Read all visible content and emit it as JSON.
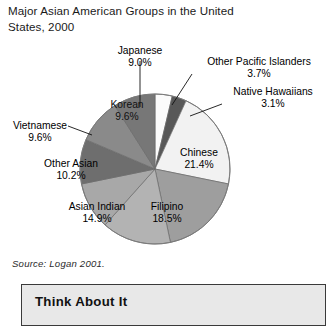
{
  "title": "Major Asian American Groups in the United\nStates, 2000",
  "source": "Source: Logan 2001.",
  "think_box": {
    "heading": "Think About It"
  },
  "chart_data": {
    "type": "pie",
    "title": "Major Asian American Groups in the United States, 2000",
    "subtitle": "",
    "xlabel": "",
    "ylabel": "",
    "units": "percent",
    "legend_position": "none",
    "labels_on_slices": true,
    "source": "Source: Logan 2001.",
    "start_angle_deg": 0,
    "direction": "clockwise",
    "categories": [
      "Other Pacific Islanders",
      "Native Hawaiians",
      "Chinese",
      "Filipino",
      "Asian Indian",
      "Other Asian",
      "Vietnamese",
      "Korean",
      "Japanese"
    ],
    "values": [
      3.7,
      3.1,
      21.4,
      18.5,
      14.9,
      10.2,
      9.6,
      9.6,
      9.0
    ],
    "slices": [
      {
        "label": "Other Pacific Islanders",
        "value": 3.7,
        "pct_text": "3.7%",
        "color": "#fbfbfb",
        "label_placement": "outside",
        "leader": true
      },
      {
        "label": "Native Hawaiians",
        "value": 3.1,
        "pct_text": "3.1%",
        "color": "#585858",
        "label_placement": "outside",
        "leader": true
      },
      {
        "label": "Chinese",
        "value": 21.4,
        "pct_text": "21.4%",
        "color": "#f2f2f2",
        "label_placement": "inside",
        "leader": false
      },
      {
        "label": "Filipino",
        "value": 18.5,
        "pct_text": "18.5%",
        "color": "#9e9e9e",
        "label_placement": "inside",
        "leader": false
      },
      {
        "label": "Asian Indian",
        "value": 14.9,
        "pct_text": "14.9%",
        "color": "#b3b3b3",
        "label_placement": "inside",
        "leader": false
      },
      {
        "label": "Other Asian",
        "value": 10.2,
        "pct_text": "10.2%",
        "color": "#a8a8a8",
        "label_placement": "inside",
        "leader": false
      },
      {
        "label": "Vietnamese",
        "value": 9.6,
        "pct_text": "9.6%",
        "color": "#6e6e6e",
        "label_placement": "outside",
        "leader": true
      },
      {
        "label": "Korean",
        "value": 9.6,
        "pct_text": "9.6%",
        "color": "#8a8a8a",
        "label_placement": "inside",
        "leader": false
      },
      {
        "label": "Japanese",
        "value": 9.0,
        "pct_text": "9.0%",
        "color": "#777777",
        "label_placement": "outside",
        "leader": true
      }
    ]
  },
  "labels": {
    "japanese": {
      "name": "Japanese",
      "pct": "9.0%"
    },
    "opi": {
      "name": "Other Pacific Islanders",
      "pct": "3.7%"
    },
    "native_haw": {
      "name": "Native Hawaiians",
      "pct": "3.1%"
    },
    "vietnamese": {
      "name": "Vietnamese",
      "pct": "9.6%"
    },
    "korean": {
      "name": "Korean",
      "pct": "9.6%"
    },
    "other_asian": {
      "name": "Other Asian",
      "pct": "10.2%"
    },
    "asian_indian": {
      "name": "Asian Indian",
      "pct": "14.9%"
    },
    "filipino": {
      "name": "Filipino",
      "pct": "18.5%"
    },
    "chinese": {
      "name": "Chinese",
      "pct": "21.4%"
    }
  }
}
